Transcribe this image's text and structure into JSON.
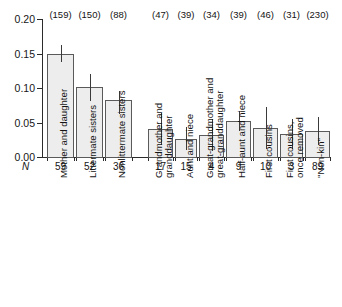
{
  "chart_data": {
    "type": "bar",
    "title": "",
    "xlabel": "",
    "ylabel": "",
    "ylim": [
      0.0,
      0.2
    ],
    "ytick_values": [
      0.2,
      0.15,
      0.1,
      0.05,
      0.0
    ],
    "ytick_labels": [
      "0.20",
      "0.15",
      "0.10",
      "0.05",
      "0.00"
    ],
    "grid": false,
    "legend": null,
    "n_axis_label": "N",
    "categories": [
      "Mother and daughter",
      "Littermate sisters",
      "Nonlittermate sisters",
      "Grandmother and\ngranddaughter",
      "Aunt and niece",
      "Great-grandmother and\ngreat-granddaughter",
      "Half-aunt and niece",
      "First cousins",
      "First cousins,\nonce removed",
      "\"Non-kin\""
    ],
    "values": [
      0.15,
      0.102,
      0.082,
      0.041,
      0.026,
      0.032,
      0.052,
      0.042,
      0.033,
      0.038
    ],
    "err_low": [
      0.138,
      0.081,
      0.063,
      0.018,
      0.01,
      0.009,
      0.038,
      0.011,
      0.012,
      0.017
    ],
    "err_high": [
      0.163,
      0.12,
      0.096,
      0.064,
      0.043,
      0.055,
      0.066,
      0.073,
      0.055,
      0.058
    ],
    "top_counts": [
      "(159)",
      "(150)",
      "(88)",
      "(47)",
      "(39)",
      "(34)",
      "(39)",
      "(46)",
      "(31)",
      "(230)"
    ],
    "n_values": [
      "59",
      "52",
      "36",
      "17",
      "15",
      "4",
      "9",
      "10",
      "3",
      "89"
    ],
    "bar_fill_color": "#ededed",
    "bar_edge_color": "#5a5a5a",
    "axis_color": "#2b2b2b"
  }
}
